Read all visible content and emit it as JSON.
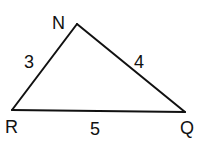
{
  "diagram": {
    "type": "triangle",
    "stroke_color": "#111111",
    "background": "#ffffff",
    "vertices": [
      {
        "id": "N",
        "label": "N",
        "x": 77,
        "y": 24,
        "label_x": 52,
        "label_y": 29
      },
      {
        "id": "R",
        "label": "R",
        "x": 12,
        "y": 110,
        "label_x": 5,
        "label_y": 133
      },
      {
        "id": "Q",
        "label": "Q",
        "x": 185,
        "y": 112,
        "label_x": 180,
        "label_y": 134
      }
    ],
    "sides": [
      {
        "id": "RN",
        "from": "R",
        "to": "N",
        "label": "3",
        "label_x": 24,
        "label_y": 68
      },
      {
        "id": "NQ",
        "from": "N",
        "to": "Q",
        "label": "4",
        "label_x": 134,
        "label_y": 68
      },
      {
        "id": "RQ",
        "from": "R",
        "to": "Q",
        "label": "5",
        "label_x": 90,
        "label_y": 135
      }
    ]
  }
}
